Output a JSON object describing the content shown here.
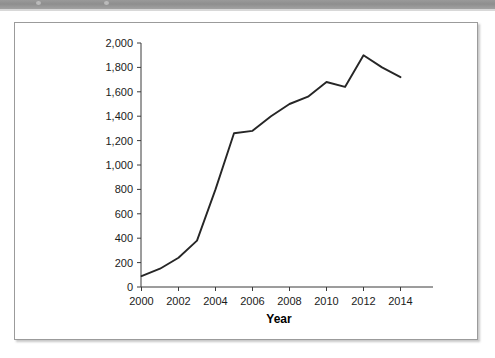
{
  "figure": {
    "header_band": {
      "name": "page-header-band",
      "color": "#939393"
    },
    "frame_color": "#9b9b9b",
    "background": "#ffffff"
  },
  "chart_data": {
    "type": "line",
    "title": "",
    "subtitle": "",
    "xlabel": "Year",
    "ylabel": "",
    "x": [
      2000,
      2001,
      2002,
      2003,
      2004,
      2005,
      2006,
      2007,
      2008,
      2009,
      2010,
      2011,
      2012,
      2013,
      2014
    ],
    "values": [
      90,
      150,
      240,
      380,
      800,
      1260,
      1280,
      1400,
      1500,
      1560,
      1680,
      1640,
      1900,
      1800,
      1720
    ],
    "series": [
      {
        "name": "series-1",
        "color": "#262626",
        "values": [
          90,
          150,
          240,
          380,
          800,
          1260,
          1280,
          1400,
          1500,
          1560,
          1680,
          1640,
          1900,
          1800,
          1720
        ]
      }
    ],
    "xlim": [
      1999,
      2015
    ],
    "ylim": [
      0,
      2000
    ],
    "y_ticks": [
      0,
      200,
      400,
      600,
      800,
      1000,
      1200,
      1400,
      1600,
      1800,
      2000
    ],
    "y_tick_labels": [
      "0",
      "200",
      "400",
      "600",
      "800",
      "1,000",
      "1,200",
      "1,400",
      "1,600",
      "1,800",
      "2,000"
    ],
    "x_ticks": [
      2000,
      2002,
      2004,
      2006,
      2008,
      2010,
      2012,
      2014
    ],
    "x_tick_labels": [
      "2000",
      "2002",
      "2004",
      "2006",
      "2008",
      "2010",
      "2012",
      "2014"
    ],
    "grid": false,
    "legend": null,
    "legend_position": "none",
    "annotations": []
  }
}
